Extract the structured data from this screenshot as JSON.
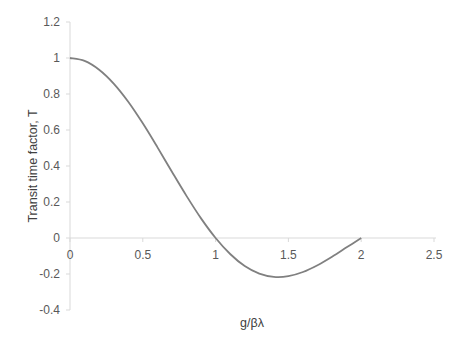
{
  "chart_data": {
    "type": "line",
    "title": "",
    "xlabel": "g/βλ",
    "ylabel": "Transit time factor, T",
    "xlim": [
      0,
      2.5
    ],
    "ylim": [
      -0.4,
      1.2
    ],
    "x_ticks": [
      "0",
      "0.5",
      "1",
      "1.5",
      "2",
      "2.5"
    ],
    "y_ticks": [
      "1.2",
      "1",
      "0.8",
      "0.6",
      "0.4",
      "0.2",
      "0",
      "-0.2",
      "-0.4"
    ],
    "grid": false,
    "legend": null,
    "series": [
      {
        "name": "T",
        "color": "#808080",
        "x": [
          0,
          0.1,
          0.2,
          0.3,
          0.4,
          0.5,
          0.6,
          0.7,
          0.8,
          0.9,
          1.0,
          1.1,
          1.2,
          1.3,
          1.4,
          1.5,
          1.6,
          1.7,
          1.8,
          1.9,
          2.0
        ],
        "y": [
          1.0,
          0.984,
          0.935,
          0.858,
          0.757,
          0.637,
          0.505,
          0.368,
          0.234,
          0.109,
          0.0,
          -0.089,
          -0.156,
          -0.198,
          -0.216,
          -0.212,
          -0.189,
          -0.151,
          -0.104,
          -0.052,
          0.0
        ]
      }
    ]
  }
}
